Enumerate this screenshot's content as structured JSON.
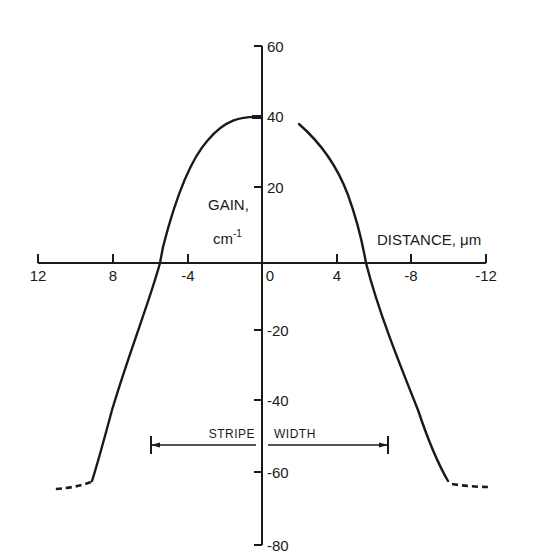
{
  "chart_data": {
    "type": "line",
    "title": "",
    "xlabel": "DISTANCE, μm",
    "ylabel_line1": "GAIN,",
    "ylabel_line2": "cm",
    "ylabel_sup": "-1",
    "x_tick_labels": [
      "12",
      "8",
      "-4",
      "0",
      "4",
      "-8",
      "-12"
    ],
    "x_tick_px": [
      38,
      113,
      188,
      262,
      337,
      411,
      486
    ],
    "y_tick_labels": [
      "60",
      "40",
      "20",
      "-20",
      "-40",
      "-60",
      "-80"
    ],
    "y_tick_values": [
      60,
      40,
      20,
      -20,
      -40,
      -60,
      -80
    ],
    "y_tick_px": [
      46,
      116,
      187,
      330,
      400,
      472,
      545
    ],
    "xlim": [
      -12,
      12
    ],
    "ylim": [
      -80,
      60
    ],
    "grid": false,
    "annotation": {
      "left_text": "STRIPE",
      "right_text": "WIDTH",
      "from_x": -6.4,
      "to_x": 6.4,
      "y": -50
    },
    "series": [
      {
        "name": "gain-left",
        "style": "solid",
        "x": [
          0,
          -1,
          -2,
          -3,
          -4,
          -5,
          -5.5,
          -6,
          -7,
          -8,
          -9
        ],
        "y": [
          40,
          39,
          35,
          28,
          19,
          7,
          0,
          -9,
          -27,
          -46,
          -62
        ]
      },
      {
        "name": "gain-left-extrapolated",
        "style": "dashed",
        "x": [
          -9,
          -10,
          -11
        ],
        "y": [
          -62,
          -64,
          -65
        ]
      },
      {
        "name": "gain-right",
        "style": "solid",
        "x": [
          2,
          3,
          4,
          5,
          5.5,
          6,
          7,
          8,
          9.5
        ],
        "y": [
          38,
          31,
          21,
          7,
          0,
          -10,
          -28,
          -46,
          -62
        ]
      },
      {
        "name": "gain-right-extrapolated",
        "style": "dashed",
        "x": [
          9.5,
          10.5,
          12
        ],
        "y": [
          -62,
          -63,
          -63
        ]
      }
    ]
  },
  "labels": {
    "gain": "GAIN,",
    "cm": "cm",
    "cm_sup": "-1",
    "distance": "DISTANCE, μm",
    "stripe": "STRIPE",
    "width": "WIDTH"
  },
  "colors": {
    "ink": "#1a1a1a",
    "background": "#ffffff"
  }
}
